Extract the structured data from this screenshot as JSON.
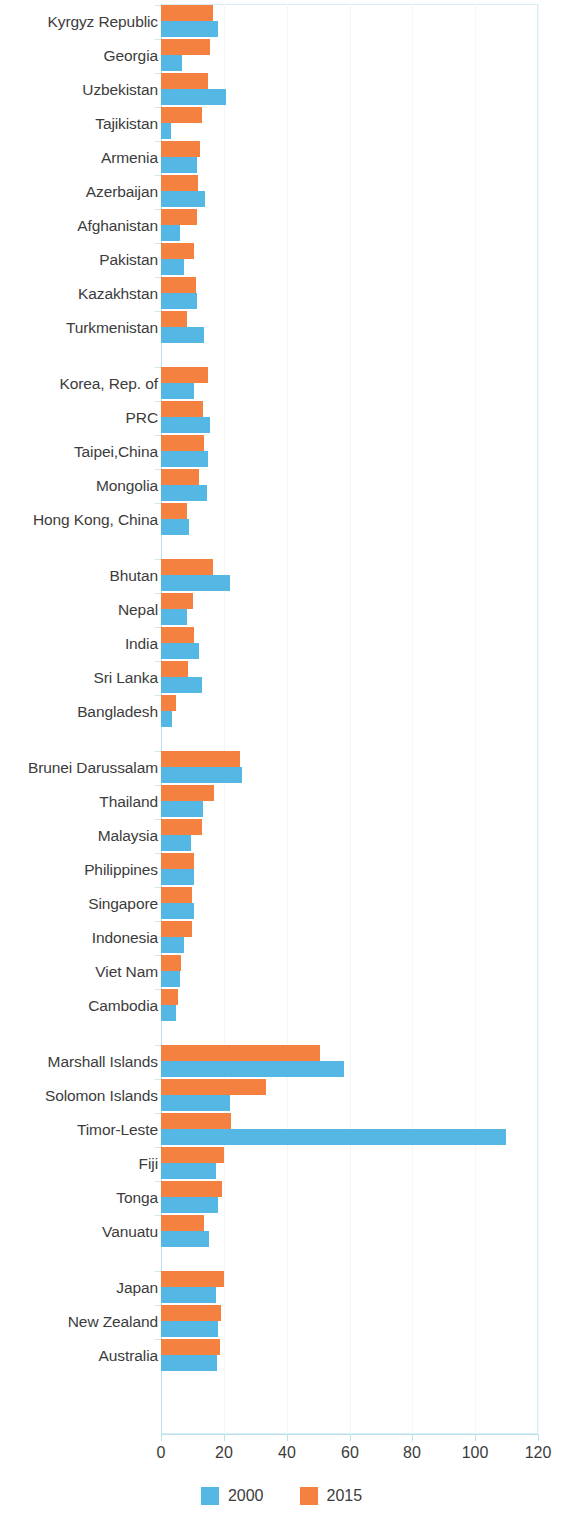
{
  "chart_data": {
    "type": "bar",
    "orientation": "horizontal",
    "title": "",
    "subtitle": "",
    "xlabel": "",
    "ylabel": "",
    "xlim": [
      0,
      120
    ],
    "xticks": [
      0,
      20,
      40,
      60,
      80,
      100,
      120
    ],
    "xtick_labels": [
      "0",
      "20",
      "40",
      "60",
      "80",
      "100",
      "120"
    ],
    "grid": true,
    "legend_position": "bottom-center",
    "colors": {
      "2000": "#54b7e4",
      "2015": "#f4813f",
      "grid": "#eef7fb",
      "axis": "#bfe2ef",
      "text": "#3c3c3c"
    },
    "legend": [
      {
        "name": "2000",
        "color": "#54b7e4"
      },
      {
        "name": "2015",
        "color": "#f4813f"
      }
    ],
    "series": [
      {
        "name": "2000",
        "color": "#54b7e4"
      },
      {
        "name": "2015",
        "color": "#f4813f"
      }
    ],
    "groups": [
      {
        "name": "Central and West Asia",
        "categories": [
          "Kyrgyz Republic",
          "Georgia",
          "Uzbekistan",
          "Tajikistan",
          "Armenia",
          "Azerbaijan",
          "Afghanistan",
          "Pakistan",
          "Kazakhstan",
          "Turkmenistan"
        ],
        "values_2000": [
          18.2,
          6.8,
          20.6,
          3.2,
          11.4,
          14.0,
          6.0,
          7.2,
          11.6,
          13.8
        ],
        "values_2015": [
          16.6,
          15.6,
          14.9,
          13.0,
          12.3,
          11.7,
          11.6,
          10.6,
          11.0,
          8.2
        ]
      },
      {
        "name": "East Asia",
        "categories": [
          "Korea, Rep. of",
          "PRC",
          "Taipei,China",
          "Mongolia",
          "Hong Kong, China"
        ],
        "values_2000": [
          10.6,
          15.6,
          15.0,
          14.7,
          8.8
        ],
        "values_2015": [
          15.0,
          13.5,
          13.6,
          12.0,
          8.4
        ]
      },
      {
        "name": "South Asia",
        "categories": [
          "Bhutan",
          "Nepal",
          "India",
          "Sri Lanka",
          "Bangladesh"
        ],
        "values_2000": [
          22.0,
          8.2,
          12.0,
          13.0,
          3.4
        ],
        "values_2015": [
          16.7,
          10.3,
          10.4,
          8.6,
          4.8
        ]
      },
      {
        "name": "Southeast Asia",
        "categories": [
          "Brunei Darussalam",
          "Thailand",
          "Malaysia",
          "Philippines",
          "Singapore",
          "Indonesia",
          "Viet Nam",
          "Cambodia"
        ],
        "values_2000": [
          25.8,
          13.4,
          9.6,
          10.6,
          10.4,
          7.2,
          6.0,
          4.8
        ],
        "values_2015": [
          25.2,
          17.0,
          13.2,
          10.6,
          10.0,
          10.0,
          6.4,
          5.4
        ]
      },
      {
        "name": "The Pacific",
        "categories": [
          "Marshall Islands",
          "Solomon Islands",
          "Timor-Leste",
          "Fiji",
          "Tonga",
          "Vanuatu"
        ],
        "values_2000": [
          58.1,
          22.0,
          109.7,
          17.5,
          18.0,
          15.4
        ],
        "values_2015": [
          50.7,
          33.5,
          22.3,
          20.0,
          19.4,
          13.7
        ]
      },
      {
        "name": "Developed Member Countries",
        "categories": [
          "Japan",
          "New Zealand",
          "Australia"
        ],
        "values_2000": [
          17.5,
          18.0,
          17.8
        ],
        "values_2015": [
          20.0,
          19.2,
          18.8
        ]
      }
    ]
  }
}
